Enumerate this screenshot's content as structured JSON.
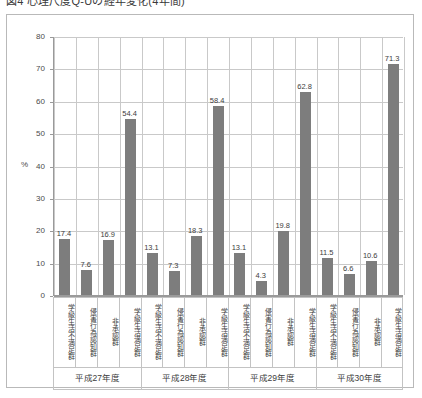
{
  "figure": {
    "title": "図4 心理尺度Q-Uの経年変化(4年間)"
  },
  "chart_data": {
    "type": "bar",
    "title": "図4 心理尺度Q-Uの経年変化(4年間)",
    "xlabel": "",
    "ylabel": "%",
    "ylim": [
      0,
      80
    ],
    "ytick_values": [
      0,
      10,
      20,
      30,
      40,
      50,
      60,
      70,
      80
    ],
    "ytick_labels": [
      "0",
      "10",
      "20",
      "30",
      "40",
      "50",
      "60",
      "70",
      "80"
    ],
    "grid": true,
    "legend": "none",
    "groups": [
      "平成27年度",
      "平成28年度",
      "平成29年度",
      "平成30年度"
    ],
    "categories": [
      "学級生活不満足群",
      "侵害行為認知群",
      "非承認群",
      "学級生活満足群"
    ],
    "series": [
      {
        "name": "平成27年度",
        "categories": [
          "学級生活不満足群",
          "侵害行為認知群",
          "非承認群",
          "学級生活満足群"
        ],
        "values": [
          17.4,
          7.6,
          16.9,
          54.4
        ]
      },
      {
        "name": "平成28年度",
        "categories": [
          "学級生活不満足群",
          "侵害行為認知群",
          "非承認群",
          "学級生活満足群"
        ],
        "values": [
          13.1,
          7.3,
          18.3,
          58.4
        ]
      },
      {
        "name": "平成29年度",
        "categories": [
          "学級生活不満足群",
          "侵害行為認知群",
          "非承認群",
          "学級生活満足群"
        ],
        "values": [
          13.1,
          4.3,
          19.8,
          62.8
        ]
      },
      {
        "name": "平成30年度",
        "categories": [
          "学級生活不満足群",
          "侵害行為認知群",
          "非承認群",
          "学級生活満足群"
        ],
        "values": [
          11.5,
          6.6,
          10.6,
          71.3
        ]
      }
    ],
    "bar_color": "#7d7d7d",
    "grid_color": "#c9c9c9",
    "axis_color": "#9a9a9a",
    "data_labels": [
      "17.4",
      "7.6",
      "16.9",
      "54.4",
      "13.1",
      "7.3",
      "18.3",
      "58.4",
      "13.1",
      "4.3",
      "19.8",
      "62.8",
      "11.5",
      "6.6",
      "10.6",
      "71.3"
    ]
  }
}
